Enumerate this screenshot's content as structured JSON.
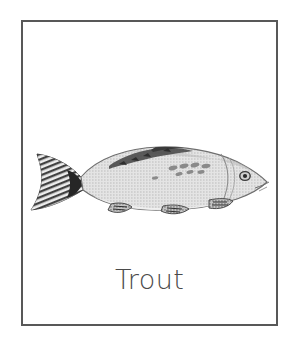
{
  "card": {
    "label": "Trout",
    "subject_icon": "fish-illustration",
    "frame_color": "#585858",
    "background_color": "#ffffff",
    "label_color": "#4a4a4a"
  },
  "illustration": {
    "name": "trout-fish-drawing",
    "description": "Side view halftone line drawing of a trout facing right",
    "body_fill": "#dcdcdc",
    "body_shade": "#c9c9c9",
    "outline_color": "#6e6e6e",
    "marking_color": "#3a3a3a",
    "tail_fill": "#2f2f2f",
    "eye_color": "#2a2a2a",
    "orientation": "facing-right"
  }
}
